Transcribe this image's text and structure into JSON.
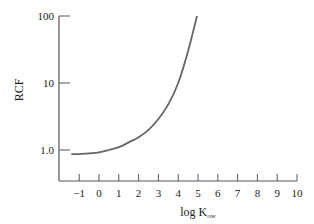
{
  "chart_data": {
    "type": "line",
    "title": "",
    "xlabel": "log K",
    "xlabel_subscript": "ow",
    "ylabel": "RCF",
    "y_scale": "log",
    "xlim": [
      -1.5,
      10
    ],
    "ylim": [
      0.6,
      100
    ],
    "x_ticks": [
      "-1",
      "0",
      "1",
      "2",
      "3",
      "4",
      "5",
      "6",
      "7",
      "8",
      "9",
      "10"
    ],
    "x_tick_values": [
      -1,
      0,
      1,
      2,
      3,
      4,
      5,
      6,
      7,
      8,
      9,
      10
    ],
    "y_ticks": [
      "1.0",
      "10",
      "100"
    ],
    "y_tick_values": [
      1,
      10,
      100
    ],
    "grid": false,
    "legend": "none",
    "series": [
      {
        "name": "RCF",
        "x": [
          -1.4,
          -1.0,
          -0.5,
          0.0,
          0.5,
          1.0,
          1.5,
          2.0,
          2.5,
          3.0,
          3.5,
          4.0,
          4.5,
          4.95
        ],
        "y": [
          0.87,
          0.87,
          0.89,
          0.92,
          1.0,
          1.1,
          1.3,
          1.55,
          2.0,
          2.9,
          4.8,
          10,
          30,
          100
        ]
      }
    ]
  }
}
